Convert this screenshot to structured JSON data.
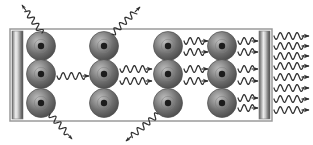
{
  "figure": {
    "width": 313,
    "height": 145,
    "background_color": "#ffffff"
  },
  "colors": {
    "stroke": "#3a3a3a",
    "cavity_border": "#9a9a9a",
    "cavity_fill": "#ffffff",
    "mirror_dark": "#4a4a4a",
    "mirror_light": "#f2f2f2",
    "mirror_mid": "#8d8d8d",
    "atom_outer": "#5c5c5c",
    "atom_highlight": "#b4b4b4",
    "atom_core": "#1c1c1c",
    "wave_color": "#2e2e2e"
  },
  "cavity": {
    "label": "optical-cavity",
    "x": 10,
    "y": 29,
    "width": 262,
    "height": 92,
    "border_width": 1.5
  },
  "mirrors": [
    {
      "name": "left-mirror",
      "label": "High reflector mirror",
      "x": 12,
      "y": 31,
      "width": 11,
      "height": 88,
      "reflectivity": "100%"
    },
    {
      "name": "right-mirror",
      "label": "Output coupler mirror",
      "x": 259,
      "y": 31,
      "width": 11,
      "height": 88,
      "reflectivity": "partial"
    }
  ],
  "atoms": {
    "label": "excited atoms in gain medium",
    "radius": 14.5,
    "core_radius": 3.2,
    "columns_x": [
      41,
      104,
      168,
      222
    ],
    "rows_y": [
      46,
      74,
      103
    ],
    "count": 12,
    "positions": [
      {
        "x": 41,
        "y": 46,
        "row": 1,
        "col": 1
      },
      {
        "x": 104,
        "y": 46,
        "row": 1,
        "col": 2
      },
      {
        "x": 168,
        "y": 46,
        "row": 1,
        "col": 3
      },
      {
        "x": 222,
        "y": 46,
        "row": 1,
        "col": 4
      },
      {
        "x": 41,
        "y": 74,
        "row": 2,
        "col": 1
      },
      {
        "x": 104,
        "y": 74,
        "row": 2,
        "col": 2
      },
      {
        "x": 168,
        "y": 74,
        "row": 2,
        "col": 3
      },
      {
        "x": 222,
        "y": 74,
        "row": 2,
        "col": 4
      },
      {
        "x": 41,
        "y": 103,
        "row": 3,
        "col": 1
      },
      {
        "x": 104,
        "y": 103,
        "row": 3,
        "col": 2
      },
      {
        "x": 168,
        "y": 103,
        "row": 3,
        "col": 3
      },
      {
        "x": 222,
        "y": 103,
        "row": 3,
        "col": 4
      }
    ]
  },
  "internal_photons": {
    "label": "stimulated emission photons travelling along cavity axis",
    "amplitude": 3.4,
    "wavelength": 8.2,
    "count": 13,
    "beams": [
      {
        "id": "r1-c3-c4-a",
        "x1": 184,
        "x2": 208,
        "y": 41,
        "direction": "right"
      },
      {
        "id": "r1-c3-c4-b",
        "x1": 184,
        "x2": 208,
        "y": 52,
        "direction": "right"
      },
      {
        "id": "r1-c4-mirror-a",
        "x1": 238,
        "x2": 258,
        "y": 41,
        "direction": "right"
      },
      {
        "id": "r1-c4-mirror-b",
        "x1": 238,
        "x2": 258,
        "y": 52,
        "direction": "right"
      },
      {
        "id": "r2-c1-c2",
        "x1": 57,
        "x2": 89,
        "y": 76,
        "direction": "right"
      },
      {
        "id": "r2-c2-c3-a",
        "x1": 120,
        "x2": 152,
        "y": 69,
        "direction": "right"
      },
      {
        "id": "r2-c2-c3-b",
        "x1": 120,
        "x2": 152,
        "y": 81,
        "direction": "right"
      },
      {
        "id": "r2-c3-c4-a",
        "x1": 184,
        "x2": 208,
        "y": 69,
        "direction": "right"
      },
      {
        "id": "r2-c3-c4-b",
        "x1": 184,
        "x2": 208,
        "y": 81,
        "direction": "right"
      },
      {
        "id": "r2-c4-mirror-a",
        "x1": 238,
        "x2": 258,
        "y": 69,
        "direction": "right"
      },
      {
        "id": "r2-c4-mirror-b",
        "x1": 238,
        "x2": 258,
        "y": 81,
        "direction": "right"
      },
      {
        "id": "r3-c4-mirror-a",
        "x1": 238,
        "x2": 258,
        "y": 98,
        "direction": "right"
      },
      {
        "id": "r3-c4-mirror-b",
        "x1": 238,
        "x2": 258,
        "y": 108,
        "direction": "right"
      }
    ]
  },
  "output_beams": {
    "label": "coherent laser output through partially transmitting mirror",
    "count": 8,
    "x_start": 274,
    "x_end": 309,
    "direction": "right",
    "y_positions": [
      36,
      46,
      56,
      66,
      77,
      88,
      99,
      110
    ]
  },
  "escaping_photons": {
    "label": "spontaneously emitted photons lost from the cavity",
    "count": 4,
    "paths": [
      {
        "id": "escape-top-left",
        "from_x": 42,
        "from_y": 33,
        "to_x": 22,
        "to_y": 5,
        "direction": "up-left"
      },
      {
        "id": "escape-top-right",
        "from_x": 112,
        "from_y": 34,
        "to_x": 140,
        "to_y": 7,
        "direction": "up-right"
      },
      {
        "id": "escape-bottom-right",
        "from_x": 50,
        "from_y": 114,
        "to_x": 72,
        "to_y": 139,
        "direction": "down-right"
      },
      {
        "id": "escape-bottom-left",
        "from_x": 158,
        "from_y": 114,
        "to_x": 126,
        "to_y": 141,
        "direction": "down-left"
      }
    ]
  }
}
